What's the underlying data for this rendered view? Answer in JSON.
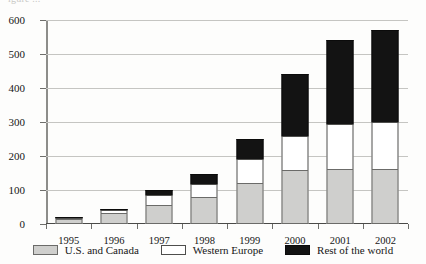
{
  "caption": {
    "cropped_text": "igure ..."
  },
  "chart_data": {
    "type": "bar",
    "stacked": true,
    "title": "",
    "xlabel": "",
    "ylabel": "",
    "ylim": [
      0,
      600
    ],
    "ytick_step": 100,
    "yticks": [
      0,
      100,
      200,
      300,
      400,
      500,
      600
    ],
    "ytick_labels": [
      "0",
      "100",
      "200",
      "300",
      "400",
      "500",
      "600"
    ],
    "grid": true,
    "legend_position": "bottom",
    "categories": [
      "1995",
      "1996",
      "1997",
      "1998",
      "1999",
      "2000",
      "2001",
      "2002"
    ],
    "series": [
      {
        "name": "U.S. and Canada",
        "color": "#cfcfcd",
        "values": [
          14,
          32,
          55,
          80,
          120,
          160,
          162,
          162
        ]
      },
      {
        "name": "Western Europe",
        "color": "#ffffff",
        "values": [
          4,
          8,
          30,
          38,
          70,
          100,
          133,
          138
        ]
      },
      {
        "name": "Rest of the world",
        "color": "#131313",
        "values": [
          2,
          2,
          15,
          30,
          60,
          180,
          245,
          270
        ]
      }
    ],
    "totals": [
      20,
      42,
      100,
      148,
      250,
      440,
      540,
      570
    ]
  }
}
